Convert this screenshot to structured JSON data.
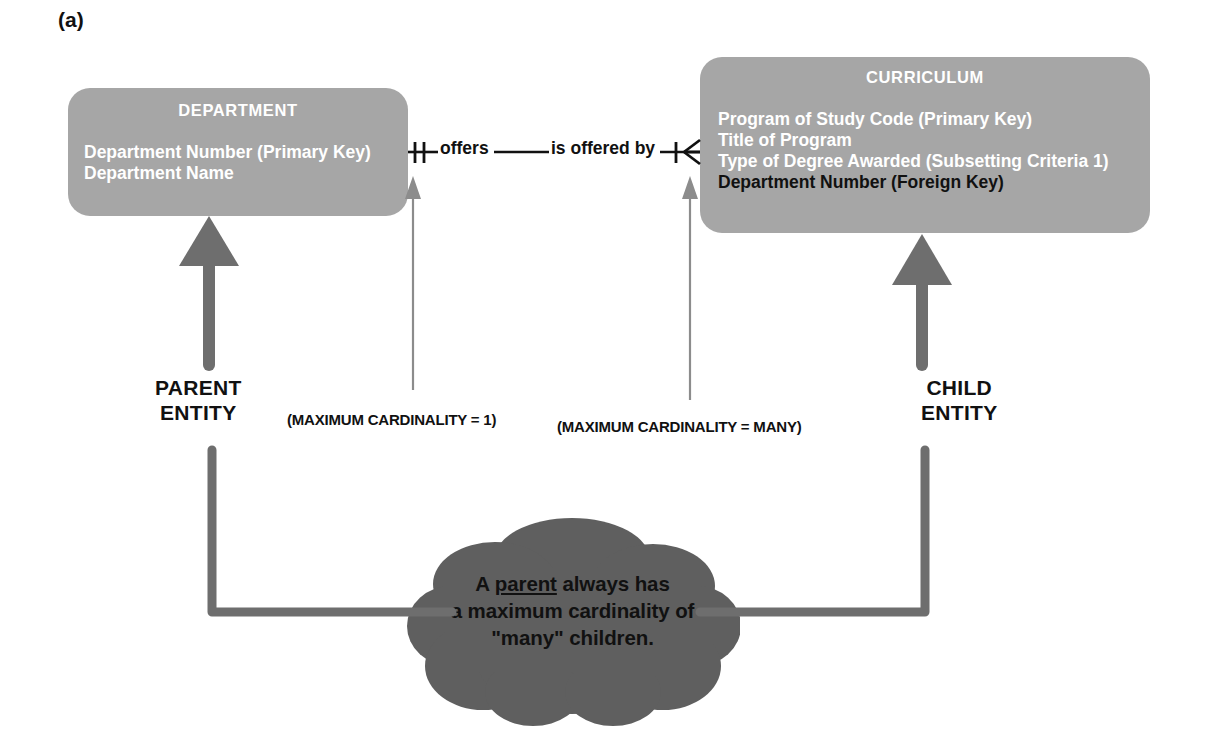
{
  "figure": {
    "label": "(a)"
  },
  "entities": [
    {
      "id": "department",
      "title": "DEPARTMENT",
      "role": "parent",
      "attributes": [
        {
          "text": "Department Number (Primary Key)",
          "emphasis": "normal"
        },
        {
          "text": "Department Name",
          "emphasis": "normal"
        }
      ]
    },
    {
      "id": "curriculum",
      "title": "CURRICULUM",
      "role": "child",
      "attributes": [
        {
          "text": "Program of Study Code (Primary Key)",
          "emphasis": "normal"
        },
        {
          "text": "Title of Program",
          "emphasis": "normal"
        },
        {
          "text": "Type of Degree Awarded (Subsetting Criteria 1)",
          "emphasis": "normal"
        },
        {
          "text": "Department Number (Foreign Key)",
          "emphasis": "foreign-key"
        }
      ]
    }
  ],
  "relationship": {
    "forward_label": "offers",
    "reverse_label": "is offered by",
    "left_cardinality_symbol": "one-and-only-one",
    "right_cardinality_symbol": "one-to-many-crows-foot"
  },
  "captions": {
    "parent_entity_line1": "PARENT",
    "parent_entity_line2": "ENTITY",
    "child_entity_line1": "CHILD",
    "child_entity_line2": "ENTITY"
  },
  "notes": {
    "max_cardinality_one": "(MAXIMUM CARDINALITY = 1)",
    "max_cardinality_many": "(MAXIMUM CARDINALITY = MANY)"
  },
  "cloud": {
    "line1_prefix": "A ",
    "line1_underlined": "parent",
    "line1_suffix": " always has",
    "line2": "a maximum cardinality of",
    "line3": "\"many\" children."
  },
  "colors": {
    "entity_fill": "#a6a6a6",
    "entity_text": "#ffffff",
    "foreign_key_text": "#111111",
    "cloud_fill": "#5f5f5f",
    "cloud_text": "#111111",
    "thick_arrow": "#6e6e6e",
    "thin_arrow": "#8c8c8c",
    "line_stroke": "#111111",
    "background": "#ffffff"
  }
}
